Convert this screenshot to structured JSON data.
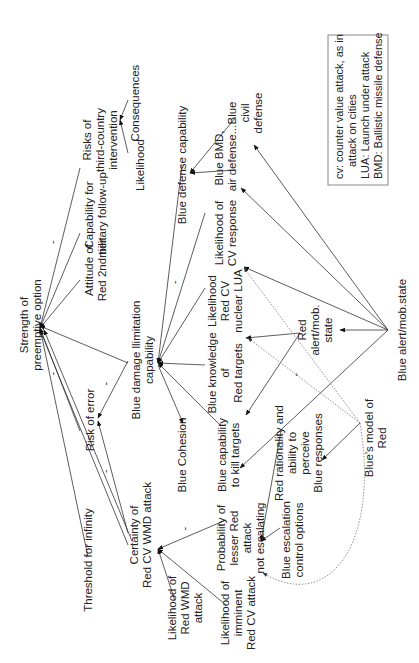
{
  "diagram": {
    "type": "causal-influence-diagram",
    "orientation": "rotated-counterclockwise",
    "nodes": [
      {
        "id": "strength",
        "label": [
          "Strength of",
          "preemptive option"
        ]
      },
      {
        "id": "attitude",
        "label": [
          "Attitude of",
          "Red 2nd tier"
        ]
      },
      {
        "id": "capability_followup",
        "label": [
          "Capability for",
          "military follow-up"
        ]
      },
      {
        "id": "risks_third",
        "label": [
          "Risks of",
          "third-country",
          "intervention"
        ]
      },
      {
        "id": "consequences",
        "label": [
          "Consequences"
        ]
      },
      {
        "id": "likelihood_top",
        "label": [
          "Likelihood"
        ]
      },
      {
        "id": "risk_error",
        "label": [
          "Risk of error"
        ]
      },
      {
        "id": "blue_damage",
        "label": [
          "Blue damage llimitation",
          "capability"
        ]
      },
      {
        "id": "threshold",
        "label": [
          "Threshold for infinity"
        ]
      },
      {
        "id": "certainty",
        "label": [
          "Certainty of",
          "Red CV WMD attack"
        ]
      },
      {
        "id": "blue_defense",
        "label": [
          "Blue defense capability"
        ]
      },
      {
        "id": "blue_bmd",
        "label": [
          "Blue BMD,",
          "air defense..."
        ]
      },
      {
        "id": "blue_civil",
        "label": [
          "Blue",
          "civil",
          "defense"
        ]
      },
      {
        "id": "likelihood_cv_resp",
        "label": [
          "Likelihood of",
          "CV response"
        ]
      },
      {
        "id": "likelihood_lua",
        "label": [
          "Likelihood",
          "Red CV",
          "nuclear LUA"
        ]
      },
      {
        "id": "blue_knowledge",
        "label": [
          "Blue knowledge",
          "of",
          "Red targets"
        ]
      },
      {
        "id": "blue_cohesion",
        "label": [
          "Blue Cohesion"
        ]
      },
      {
        "id": "blue_kill",
        "label": [
          "Blue capability",
          "to kill targets"
        ]
      },
      {
        "id": "red_alert",
        "label": [
          "Red",
          "alert/mob.",
          "state"
        ]
      },
      {
        "id": "blue_alert",
        "label": [
          "Blue alert/mob.state"
        ]
      },
      {
        "id": "likelihood_red_wmd",
        "label": [
          "Likelihood of",
          "Red WMD",
          "attack"
        ]
      },
      {
        "id": "likelihood_imminent",
        "label": [
          "Likelihood of",
          "imminent",
          "Red CV attack"
        ]
      },
      {
        "id": "prob_lesser",
        "label": [
          "Probability of",
          "lesser Red",
          "attack",
          "not escalating"
        ]
      },
      {
        "id": "blue_escalation",
        "label": [
          "Blue escalation",
          "control options"
        ]
      },
      {
        "id": "red_rationality",
        "label": [
          "Red rationality and",
          "ability to",
          "perceive",
          "Blue responses"
        ]
      },
      {
        "id": "blue_model",
        "label": [
          "Blue's model of",
          "Red"
        ]
      }
    ],
    "edges": [
      {
        "from": "attitude",
        "to": "strength"
      },
      {
        "from": "capability_followup",
        "to": "strength"
      },
      {
        "from": "risks_third",
        "to": "strength",
        "sign": "-"
      },
      {
        "from": "blue_damage",
        "to": "strength"
      },
      {
        "from": "risk_error",
        "to": "strength",
        "sign": "-"
      },
      {
        "from": "threshold",
        "to": "strength"
      },
      {
        "from": "certainty",
        "to": "strength"
      },
      {
        "from": "certainty",
        "to": "strength"
      },
      {
        "from": "blue_damage",
        "to": "risk_error",
        "sign": "-"
      },
      {
        "from": "certainty",
        "to": "risk_error",
        "sign": "-"
      },
      {
        "from": "consequences",
        "to": "risks_third"
      },
      {
        "from": "likelihood_top",
        "to": "risks_third"
      },
      {
        "from": "blue_defense",
        "to": "blue_damage"
      },
      {
        "from": "likelihood_cv_resp",
        "to": "blue_damage",
        "sign": "-"
      },
      {
        "from": "likelihood_lua",
        "to": "blue_damage"
      },
      {
        "from": "blue_knowledge",
        "to": "blue_damage"
      },
      {
        "from": "blue_kill",
        "to": "blue_damage"
      },
      {
        "from": "blue_damage",
        "to": "blue_cohesion"
      },
      {
        "from": "blue_bmd",
        "to": "blue_defense"
      },
      {
        "from": "blue_civil",
        "to": "blue_defense"
      },
      {
        "from": "red_alert",
        "to": "likelihood_lua"
      },
      {
        "from": "red_alert",
        "to": "blue_knowledge"
      },
      {
        "from": "blue_alert",
        "to": "red_alert"
      },
      {
        "from": "blue_alert",
        "to": "likelihood_cv_resp"
      },
      {
        "from": "blue_alert",
        "to": "blue_bmd"
      },
      {
        "from": "blue_alert",
        "to": "blue_civil"
      },
      {
        "from": "blue_alert",
        "to": "blue_kill"
      },
      {
        "from": "likelihood_red_wmd",
        "to": "certainty"
      },
      {
        "from": "likelihood_imminent",
        "to": "certainty"
      },
      {
        "from": "prob_lesser",
        "to": "certainty",
        "sign": "-"
      },
      {
        "from": "blue_escalation",
        "to": "prob_lesser"
      },
      {
        "from": "red_rationality",
        "to": "prob_lesser"
      },
      {
        "from": "blue_model",
        "to": "red_rationality"
      },
      {
        "from": "blue_model",
        "to": "likelihood_cv_resp",
        "style": "dotted"
      },
      {
        "from": "blue_model",
        "to": "likelihood_lua",
        "style": "dotted",
        "sign": "-"
      },
      {
        "from": "blue_model",
        "to": "likelihood_imminent",
        "style": "dotted"
      }
    ]
  },
  "legend": {
    "lines": [
      "cv: counter value attack, as in",
      "attack on cities",
      "LUA: Launch under attack",
      "BMD: Ballistic missile defense"
    ]
  }
}
